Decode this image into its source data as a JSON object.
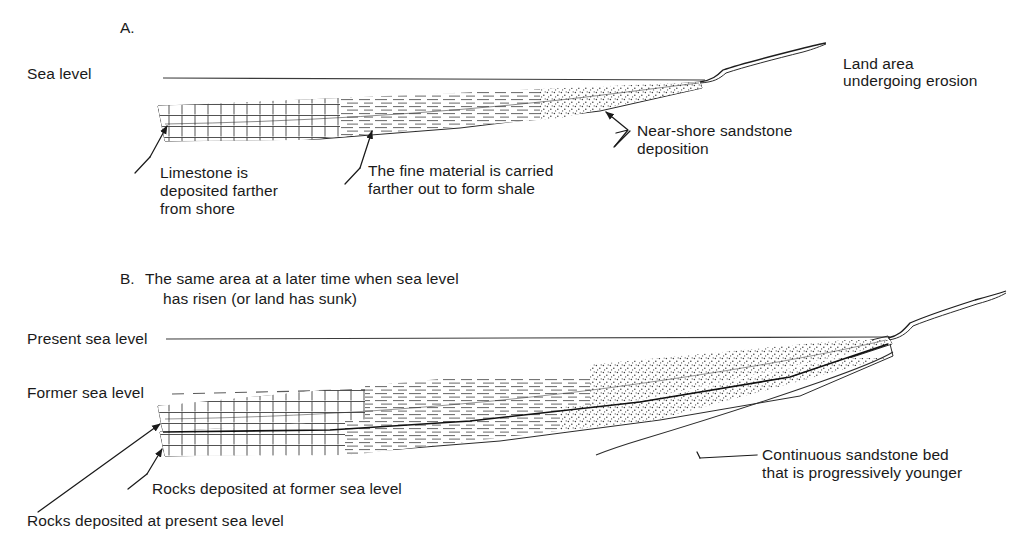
{
  "figure": {
    "title_visible": false,
    "background_color": "#ffffff",
    "ink_color": "#1a1a1a"
  },
  "panelA": {
    "letter": "A.",
    "sea_level_label": "Sea level",
    "land_label_line1": "Land area",
    "land_label_line2": "undergoing erosion",
    "sandstone_label_line1": "Near-shore sandstone",
    "sandstone_label_line2": "deposition",
    "shale_label_line1": "The fine material is carried",
    "shale_label_line2": "farther out to form shale",
    "limestone_label_line1": "Limestone is",
    "limestone_label_line2": "deposited farther",
    "limestone_label_line3": "from shore"
  },
  "panelB": {
    "letter": "B.",
    "caption_line1": "The same area at a later time when sea level",
    "caption_line2": "has risen (or land has sunk)",
    "present_sea_level_label": "Present sea level",
    "former_sea_level_label": "Former sea level",
    "sandstone_bed_label_line1": "Continuous sandstone bed",
    "sandstone_bed_label_line2": "that is progressively younger",
    "former_rocks_label": "Rocks deposited at former sea level",
    "present_rocks_label": "Rocks deposited at present sea level"
  },
  "legend_patterns": {
    "limestone": "brick-pattern",
    "shale": "dash-pattern",
    "sandstone": "stipple-pattern"
  }
}
